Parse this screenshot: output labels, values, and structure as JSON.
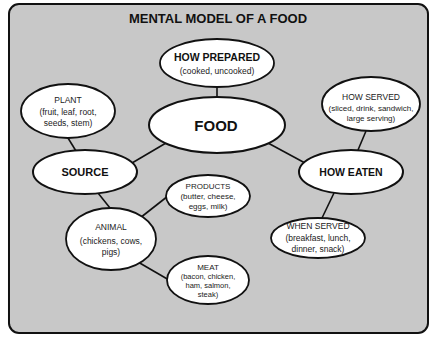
{
  "diagram": {
    "title": "MENTAL MODEL OF A FOOD",
    "colors": {
      "background": "#c8c8c8",
      "node_fill": "#ffffff",
      "stroke": "#111111"
    },
    "nodes": {
      "food": {
        "label": "FOOD"
      },
      "how_prepared": {
        "label": "HOW PREPARED",
        "detail": "(cooked, uncooked)"
      },
      "plant": {
        "label": "PLANT",
        "detail_1": "(fruit, leaf, root,",
        "detail_2": "seeds, stem)"
      },
      "source": {
        "label": "SOURCE"
      },
      "how_served": {
        "label": "HOW SERVED",
        "detail_1": "(sliced, drink, sandwich,",
        "detail_2": "large serving)"
      },
      "how_eaten": {
        "label": "HOW EATEN"
      },
      "products": {
        "label": "PRODUCTS",
        "detail_1": "(butter, cheese,",
        "detail_2": "eggs, milk)"
      },
      "animal": {
        "label": "ANIMAL",
        "detail_1": "(chickens, cows,",
        "detail_2": "pigs)"
      },
      "meat": {
        "label": "MEAT",
        "detail_1": "(bacon, chicken,",
        "detail_2": "ham, salmon,",
        "detail_3": "steak)"
      },
      "when_served": {
        "label": "WHEN SERVED",
        "detail_1": "(breakfast, lunch,",
        "detail_2": "dinner, snack)"
      }
    },
    "edges": [
      [
        "how_prepared",
        "food"
      ],
      [
        "food",
        "source"
      ],
      [
        "food",
        "how_eaten"
      ],
      [
        "plant",
        "source"
      ],
      [
        "source",
        "animal"
      ],
      [
        "animal",
        "products"
      ],
      [
        "animal",
        "meat"
      ],
      [
        "how_served",
        "how_eaten"
      ],
      [
        "how_eaten",
        "when_served"
      ]
    ]
  }
}
